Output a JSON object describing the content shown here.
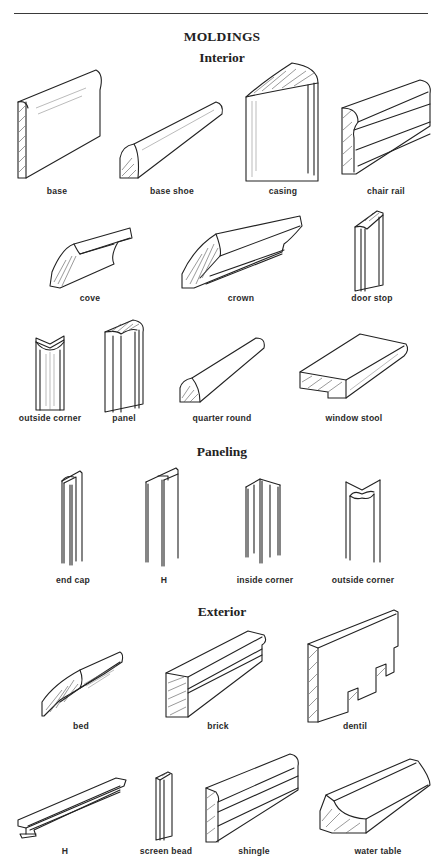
{
  "title": "MOLDINGS",
  "sections": {
    "interior": {
      "heading": "Interior",
      "rows": [
        [
          {
            "name": "base"
          },
          {
            "name": "base shoe"
          },
          {
            "name": "casing"
          },
          {
            "name": "chair rail"
          }
        ],
        [
          {
            "name": "cove"
          },
          {
            "name": "crown"
          },
          {
            "name": "door stop"
          }
        ],
        [
          {
            "name": "outside corner"
          },
          {
            "name": "panel"
          },
          {
            "name": "quarter round"
          },
          {
            "name": "window stool"
          }
        ]
      ]
    },
    "paneling": {
      "heading": "Paneling",
      "rows": [
        [
          {
            "name": "end cap"
          },
          {
            "name": "H"
          },
          {
            "name": "inside corner"
          },
          {
            "name": "outside corner"
          }
        ]
      ]
    },
    "exterior": {
      "heading": "Exterior",
      "rows": [
        [
          {
            "name": "bed"
          },
          {
            "name": "brick"
          },
          {
            "name": "dentil"
          }
        ],
        [
          {
            "name": "H"
          },
          {
            "name": "screen bead"
          },
          {
            "name": "shingle"
          },
          {
            "name": "water table"
          }
        ]
      ]
    }
  },
  "colors": {
    "ink": "#222222",
    "background": "#ffffff"
  }
}
